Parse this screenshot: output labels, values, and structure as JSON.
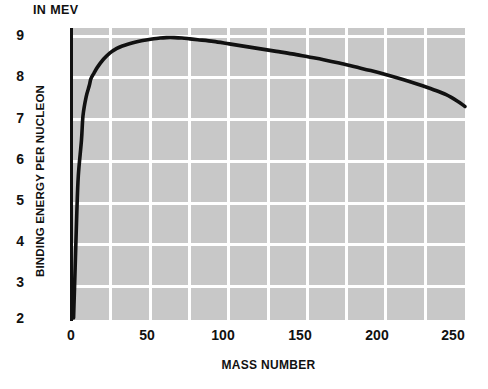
{
  "chart_data": {
    "type": "line",
    "title": "",
    "subtitle": "",
    "unit_label": "IN MEV",
    "xlabel": "MASS NUMBER",
    "ylabel": "BINDING ENERGY PER NUCLEON",
    "xlim": [
      0,
      250
    ],
    "ylim": [
      2,
      9
    ],
    "grid": true,
    "grid_color": "#ffffff",
    "plot_background": "#c8c8c8",
    "line_color": "#111111",
    "legend": null,
    "xticks": [
      0,
      50,
      100,
      150,
      200,
      250
    ],
    "xtick_labels": [
      "0",
      "50",
      "100",
      "150",
      "200",
      "250"
    ],
    "yticks": [
      2,
      3,
      4,
      5,
      6,
      7,
      8,
      9
    ],
    "ytick_labels": [
      "2",
      "3",
      "4",
      "5",
      "6",
      "7",
      "8",
      "9"
    ],
    "x_minor_gridlines": [
      25,
      50,
      75,
      100,
      125,
      150,
      175,
      200,
      225
    ],
    "series": [
      {
        "name": "binding energy per nucleon",
        "x": [
          1,
          2,
          3,
          4,
          6,
          7,
          9,
          11,
          12,
          14,
          16,
          20,
          24,
          28,
          32,
          40,
          45,
          50,
          56,
          60,
          65,
          70,
          75,
          80,
          90,
          100,
          110,
          120,
          130,
          140,
          150,
          160,
          170,
          180,
          190,
          200,
          210,
          220,
          230,
          238,
          245,
          250
        ],
        "y": [
          2.05,
          3.25,
          4.5,
          5.45,
          6.3,
          6.9,
          7.35,
          7.62,
          7.78,
          7.92,
          8.05,
          8.25,
          8.4,
          8.5,
          8.57,
          8.66,
          8.7,
          8.73,
          8.76,
          8.77,
          8.77,
          8.76,
          8.74,
          8.72,
          8.68,
          8.62,
          8.56,
          8.5,
          8.44,
          8.38,
          8.31,
          8.24,
          8.16,
          8.07,
          7.98,
          7.88,
          7.77,
          7.65,
          7.52,
          7.4,
          7.25,
          7.12
        ]
      }
    ]
  },
  "axes": {
    "unit_label": "IN MEV",
    "xlabel": "MASS NUMBER",
    "ylabel": "BINDING ENERGY PER NUCLEON",
    "ytick_labels": [
      "9",
      "8",
      "7",
      "6",
      "5",
      "4",
      "3",
      "2"
    ],
    "xtick_labels": [
      "0",
      "50",
      "100",
      "150",
      "200",
      "250"
    ]
  }
}
